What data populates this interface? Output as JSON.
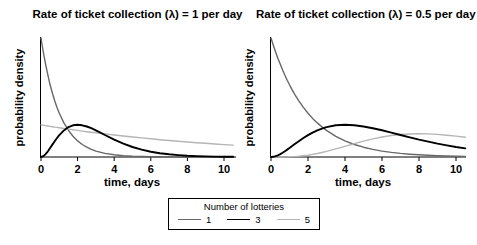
{
  "figure": {
    "background": "#ffffff"
  },
  "legend": {
    "title": "Number of lotteries",
    "position": "bottom-center",
    "items": [
      {
        "label": "1",
        "color": "#686868",
        "line_width": 1.4
      },
      {
        "label": "3",
        "color": "#000000",
        "line_width": 1.9
      },
      {
        "label": "5",
        "color": "#b5b5b5",
        "line_width": 1.4
      }
    ]
  },
  "chart_data": [
    {
      "type": "line",
      "title": "Rate of ticket collection (λ) = 1 per day",
      "xlabel": "time, days",
      "ylabel": "probability density",
      "x_ticks": [
        0,
        2,
        4,
        6,
        8,
        10
      ],
      "xlim": [
        0,
        10.5
      ],
      "ylim": [
        0,
        1.0
      ],
      "y_tick_labels": "none",
      "grid": false,
      "x": [
        0,
        0.125,
        0.25,
        0.375,
        0.5,
        0.625,
        0.75,
        0.875,
        1,
        1.25,
        1.5,
        1.75,
        2,
        2.25,
        2.5,
        2.75,
        3,
        3.5,
        4,
        4.5,
        5,
        5.5,
        6,
        6.5,
        7,
        7.5,
        8,
        8.5,
        9,
        9.5,
        10,
        10.5
      ],
      "series": [
        {
          "name": "1",
          "color": "#686868",
          "width": 1.4,
          "values": [
            1,
            0.8825,
            0.7788,
            0.6873,
            0.6065,
            0.5353,
            0.4724,
            0.4169,
            0.3679,
            0.2865,
            0.2231,
            0.1738,
            0.1353,
            0.1054,
            0.0821,
            0.0639,
            0.0498,
            0.0302,
            0.0183,
            0.0111,
            0.0067,
            0.0041,
            0.0025,
            0.0015,
            0.0009,
            0.0006,
            0.0003,
            0.0002,
            0.0001,
            0.0001,
            0.0001,
            0
          ]
        },
        {
          "name": "3",
          "color": "#000000",
          "width": 1.9,
          "values": [
            0,
            0.0069,
            0.0243,
            0.0483,
            0.0758,
            0.1045,
            0.1329,
            0.1596,
            0.1839,
            0.2238,
            0.251,
            0.2661,
            0.2707,
            0.2668,
            0.2565,
            0.2416,
            0.224,
            0.185,
            0.1465,
            0.1125,
            0.0842,
            0.0618,
            0.0446,
            0.0317,
            0.0223,
            0.0156,
            0.0107,
            0.0073,
            0.005,
            0.0034,
            0.0023,
            0.0015
          ]
        },
        {
          "name": "5",
          "color": "#b5b5b5",
          "width": 1.4,
          "values": [
            0.27,
            0.2668,
            0.2637,
            0.2605,
            0.2575,
            0.2544,
            0.2514,
            0.2485,
            0.2455,
            0.2397,
            0.2341,
            0.2286,
            0.2233,
            0.218,
            0.2129,
            0.2079,
            0.2031,
            0.1937,
            0.1847,
            0.1761,
            0.168,
            0.1602,
            0.1528,
            0.1457,
            0.1389,
            0.1325,
            0.1264,
            0.1205,
            0.1149,
            0.1096,
            0.1045,
            0.0997
          ]
        }
      ]
    },
    {
      "type": "line",
      "title": "Rate of ticket collection (λ) = 0.5 per day",
      "xlabel": "time, days",
      "ylabel": "probability density",
      "x_ticks": [
        0,
        2,
        4,
        6,
        8,
        10
      ],
      "xlim": [
        0,
        10.5
      ],
      "ylim": [
        0,
        0.5
      ],
      "y_tick_labels": "none",
      "grid": false,
      "x": [
        0,
        0.125,
        0.25,
        0.375,
        0.5,
        0.625,
        0.75,
        0.875,
        1,
        1.25,
        1.5,
        1.75,
        2,
        2.25,
        2.5,
        2.75,
        3,
        3.5,
        4,
        4.5,
        5,
        5.5,
        6,
        6.5,
        7,
        7.5,
        8,
        8.5,
        9,
        9.5,
        10,
        10.5
      ],
      "series": [
        {
          "name": "1",
          "color": "#686868",
          "width": 1.4,
          "values": [
            0.5,
            0.4697,
            0.4412,
            0.4144,
            0.3894,
            0.3657,
            0.3436,
            0.3227,
            0.3033,
            0.2676,
            0.2362,
            0.2084,
            0.1839,
            0.1623,
            0.1433,
            0.1264,
            0.1116,
            0.0869,
            0.0677,
            0.0527,
            0.041,
            0.032,
            0.0249,
            0.0194,
            0.0151,
            0.0118,
            0.0092,
            0.0071,
            0.0056,
            0.0043,
            0.0034,
            0.0026
          ]
        },
        {
          "name": "3",
          "color": "#000000",
          "width": 1.9,
          "values": [
            0,
            0.0009,
            0.0034,
            0.0073,
            0.0122,
            0.0179,
            0.0242,
            0.0309,
            0.0379,
            0.0523,
            0.0664,
            0.0798,
            0.092,
            0.1027,
            0.1119,
            0.1195,
            0.1255,
            0.1331,
            0.1353,
            0.1334,
            0.1283,
            0.1209,
            0.112,
            0.1024,
            0.0925,
            0.0827,
            0.0733,
            0.0645,
            0.0562,
            0.0488,
            0.0421,
            0.0361
          ]
        },
        {
          "name": "5",
          "color": "#b5b5b5",
          "width": 1.4,
          "values": [
            0,
            0,
            0,
            0,
            0.0001,
            0.0001,
            0.0003,
            0.0005,
            0.0008,
            0.0017,
            0.0031,
            0.0051,
            0.0077,
            0.0108,
            0.0146,
            0.0188,
            0.0235,
            0.034,
            0.0451,
            0.0563,
            0.0668,
            0.0761,
            0.084,
            0.0902,
            0.0944,
            0.0968,
            0.0976,
            0.0972,
            0.0948,
            0.0918,
            0.0877,
            0.0831
          ]
        }
      ]
    }
  ]
}
